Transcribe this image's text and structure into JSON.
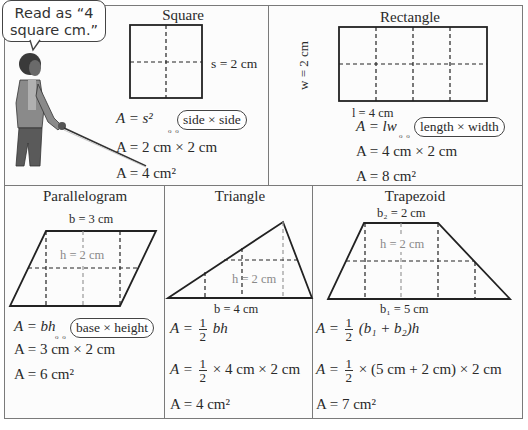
{
  "speech_bubble": {
    "line1": "Read as “4",
    "line2": "square cm.”"
  },
  "square": {
    "title": "Square",
    "dimension_label": "s = 2 cm",
    "formula": "A = s²",
    "cloud": "side × side",
    "substitution": "A = 2 cm × 2 cm",
    "result": "A = 4 cm²"
  },
  "rectangle": {
    "title": "Rectangle",
    "width_label": "w = 2 cm",
    "length_label": "l = 4 cm",
    "formula": "A = lw",
    "cloud": "length × width",
    "substitution": "A = 4 cm × 2 cm",
    "result": "A = 8 cm²"
  },
  "parallelogram": {
    "title": "Parallelogram",
    "base_label": "b = 3 cm",
    "height_label": "h = 2 cm",
    "formula": "A = bh",
    "cloud": "base × height",
    "substitution": "A = 3 cm × 2 cm",
    "result": "A = 6 cm²"
  },
  "triangle": {
    "title": "Triangle",
    "base_label": "b = 4 cm",
    "height_label": "h = 2 cm",
    "formula_prefix": "A =",
    "formula_suffix": "bh",
    "substitution_prefix": "A =",
    "substitution_suffix": "× 4 cm × 2 cm",
    "fraction_num": "1",
    "fraction_den": "2",
    "result": "A = 4 cm²"
  },
  "trapezoid": {
    "title": "Trapezoid",
    "top_base_label": "b₂ = 2 cm",
    "bottom_base_label": "b₁ = 5 cm",
    "height_label": "h = 2 cm",
    "formula_prefix": "A =",
    "formula_suffix": "(b₁ + b₂)h",
    "substitution_prefix": "A =",
    "substitution_suffix": "× (5 cm + 2 cm) × 2 cm",
    "fraction_num": "1",
    "fraction_den": "2",
    "result": "A = 7 cm²"
  }
}
